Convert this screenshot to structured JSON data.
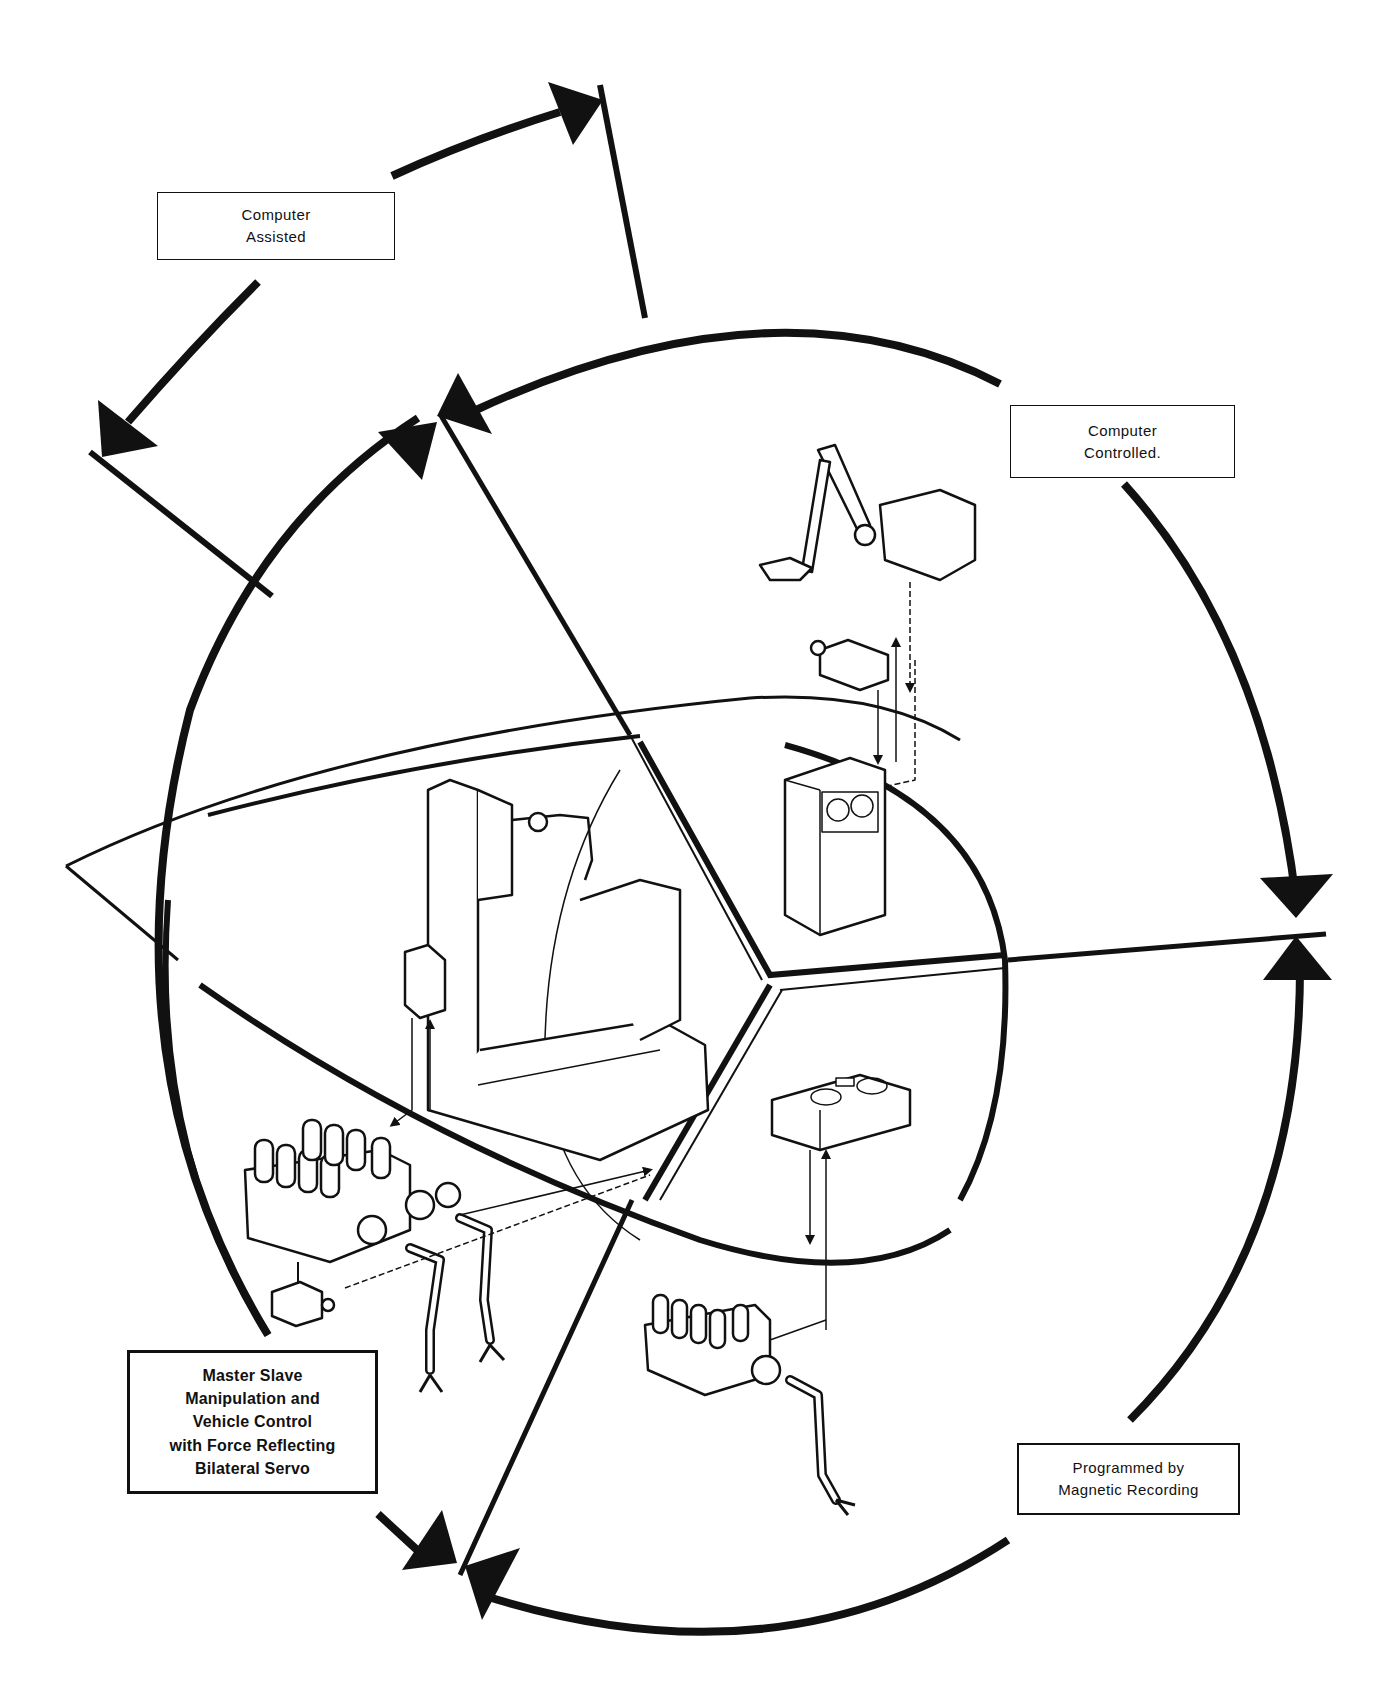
{
  "diagram": {
    "modes": [
      {
        "id": "computer-assisted",
        "lines": [
          "Computer",
          "Assisted"
        ]
      },
      {
        "id": "computer-controlled",
        "lines": [
          "Computer",
          "Controlled."
        ]
      },
      {
        "id": "master-slave",
        "lines": [
          "Master Slave",
          "Manipulation and",
          "Vehicle Control",
          "with Force Reflecting",
          "Bilateral Servo"
        ]
      },
      {
        "id": "programmed",
        "lines": [
          "Programmed by",
          "Magnetic Recording"
        ]
      }
    ],
    "illustrations": [
      {
        "id": "operator-console",
        "description": "Operator seated at control console with hand controller"
      },
      {
        "id": "master-slave-manipulator",
        "description": "Dual-arm manipulator unit with camera and grippers"
      },
      {
        "id": "computer-unit",
        "description": "Tape-reel computer cabinet with manipulator arm and camera"
      },
      {
        "id": "tape-recorder-unit",
        "description": "Magnetic tape recorder driving single-arm manipulator"
      }
    ],
    "colors": {
      "ink": "#111111",
      "paper": "#ffffff"
    }
  }
}
